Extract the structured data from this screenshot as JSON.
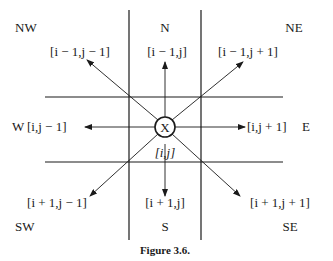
{
  "figure": {
    "caption": "Figure 3.6.",
    "center": {
      "symbol": "X",
      "index": "[i,j]"
    },
    "directions": {
      "nw": {
        "name": "NW",
        "index": "[i − 1,j − 1]"
      },
      "n": {
        "name": "N",
        "index": "[i − 1,j]"
      },
      "ne": {
        "name": "NE",
        "index": "[i − 1,j + 1]"
      },
      "w": {
        "name": "W",
        "index": "[i,j − 1]"
      },
      "e": {
        "name": "E",
        "index": "[i,j + 1]"
      },
      "sw": {
        "name": "SW",
        "index": "[i + 1,j − 1]"
      },
      "s": {
        "name": "S",
        "index": "[i + 1,j]"
      },
      "se": {
        "name": "SE",
        "index": "[i + 1,j + 1]"
      }
    },
    "colors": {
      "ink": "#1a1a1a",
      "background": "#ffffff"
    }
  }
}
